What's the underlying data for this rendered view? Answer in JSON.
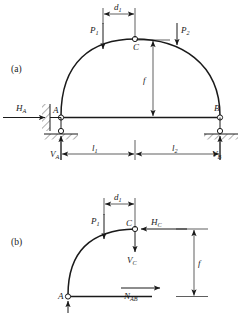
{
  "figure": {
    "type": "engineering-diagram",
    "panels": [
      {
        "tag": "(a)",
        "name": "three-hinged-arch-full",
        "description": "Three-hinged arch A-C-B with horizontal tie bar AB on supports"
      },
      {
        "tag": "(b)",
        "name": "left-half-free-body",
        "description": "Free body diagram of left half segment A-C"
      }
    ]
  },
  "panel_a": {
    "tag": "(a)",
    "points": {
      "a": "A",
      "b": "B",
      "c": "C"
    },
    "loads": {
      "p1": "P",
      "p1_sub": "1",
      "p2": "P",
      "p2_sub": "2"
    },
    "reactions": {
      "ha": "H",
      "ha_sub": "A",
      "va": "V",
      "va_sub": "A",
      "vb": "V",
      "vb_sub": "B"
    },
    "dimensions": {
      "d1": "d",
      "d1_sub": "1",
      "l1": "l",
      "l1_sub": "1",
      "l2": "l",
      "l2_sub": "2",
      "f": "f"
    }
  },
  "panel_b": {
    "tag": "(b)",
    "points": {
      "a": "A",
      "c": "C"
    },
    "loads": {
      "p1": "P",
      "p1_sub": "1"
    },
    "internal_forces": {
      "hc": "H",
      "hc_sub": "C",
      "vc": "V",
      "vc_sub": "C",
      "nab": "N",
      "nab_sub": "AB"
    },
    "dimensions": {
      "d1": "d",
      "d1_sub": "1",
      "f": "f"
    }
  },
  "colors": {
    "ink": "#1a1a1a",
    "paper": "#ffffff"
  }
}
